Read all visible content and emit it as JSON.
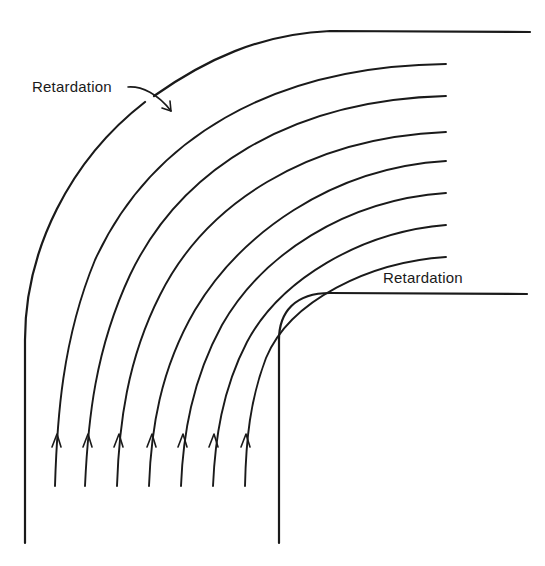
{
  "diagram": {
    "type": "flow-streamlines-in-90-degree-bend",
    "labels": {
      "outer_retardation": "Retardation",
      "inner_retardation": "Retardation"
    },
    "walls": {
      "outer": "outer wall of bend (large radius)",
      "inner": "inner wall of bend (small radius)"
    },
    "streamlines": {
      "count": 7,
      "flow_direction": "upward, then turning right",
      "start_x": [
        55,
        85,
        117,
        149,
        181,
        213,
        245
      ],
      "start_y": 486,
      "end_x": 446,
      "end_y": [
        64,
        96,
        132,
        161,
        193,
        225,
        257
      ]
    },
    "colors": {
      "line": "#1a1a1a",
      "background": "#ffffff"
    }
  }
}
